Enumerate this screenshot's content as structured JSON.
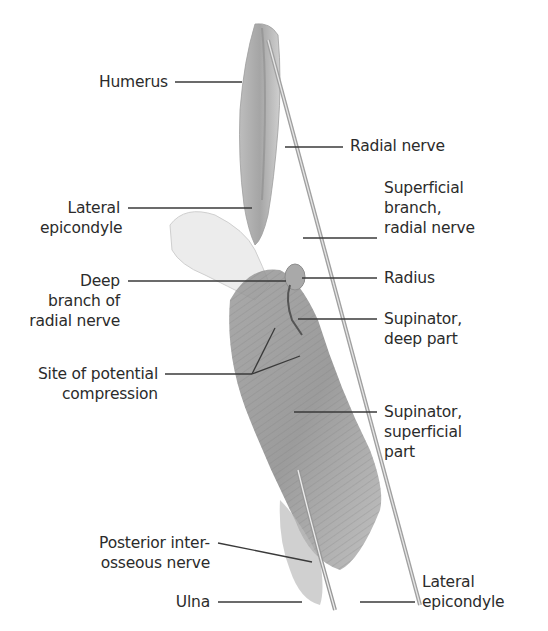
{
  "figure": {
    "colors": {
      "background": "#ffffff",
      "leader_line": "#3a3a3a",
      "text": "#2b2b2b",
      "muscle_dark": "#8a8a8a",
      "muscle_light": "#c8c8c8",
      "bone": "#d8d8d8"
    }
  },
  "labels": {
    "humerus": [
      "Humerus"
    ],
    "radial_nerve": [
      "Radial nerve"
    ],
    "lateral_epicondyle_top": [
      "Lateral",
      "epicondyle"
    ],
    "superficial_branch": [
      "Superficial",
      "branch,",
      "radial nerve"
    ],
    "deep_branch": [
      "Deep",
      "branch  of",
      "radial nerve"
    ],
    "radius": [
      "Radius"
    ],
    "supinator_deep": [
      "Supinator,",
      "deep part"
    ],
    "site_compression": [
      "Site of potential",
      "compression"
    ],
    "supinator_superficial": [
      "Supinator,",
      "superficial",
      "part"
    ],
    "posterior_interosseous": [
      "Posterior inter-",
      "osseous nerve"
    ],
    "ulna": [
      "Ulna"
    ],
    "lateral_epicondyle_bottom": [
      "Lateral",
      "epicondyle"
    ]
  }
}
